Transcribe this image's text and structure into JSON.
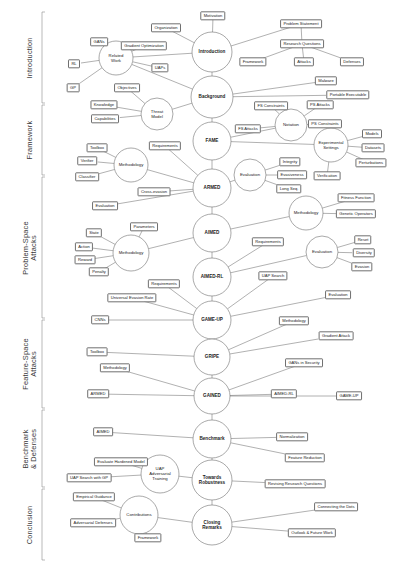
{
  "diagram": {
    "type": "mind-map",
    "stroke_color": "#6f6f6f",
    "text_color": "#1c1c1c",
    "background": "#ffffff"
  },
  "sections": [
    {
      "id": "introduction",
      "label": "Introduction",
      "y_top": 12,
      "y_bottom": 103
    },
    {
      "id": "framework",
      "label": "Framework",
      "y_top": 105,
      "y_bottom": 175
    },
    {
      "id": "ps-attacks",
      "label": "Problem-Space\nAttacks",
      "y_top": 177,
      "y_bottom": 318
    },
    {
      "id": "fs-attacks",
      "label": "Feature-Space\nAttacks",
      "y_top": 320,
      "y_bottom": 408
    },
    {
      "id": "benchmark",
      "label": "Benchmark\n& Defenses",
      "y_top": 410,
      "y_bottom": 487
    },
    {
      "id": "conclusion",
      "label": "Conclusion",
      "y_top": 489,
      "y_bottom": 560
    }
  ],
  "hubs": [
    {
      "id": "introduction",
      "label": "Introduction",
      "cx": 212,
      "cy": 52,
      "rx": 20,
      "ry": 20,
      "main": true
    },
    {
      "id": "background",
      "label": "Background",
      "cx": 212,
      "cy": 97,
      "rx": 21,
      "ry": 21,
      "main": true
    },
    {
      "id": "fame",
      "label": "FAME",
      "cx": 212,
      "cy": 141,
      "rx": 19,
      "ry": 19,
      "main": true
    },
    {
      "id": "armed",
      "label": "ARMED",
      "cx": 212,
      "cy": 188,
      "rx": 19,
      "ry": 19,
      "main": true
    },
    {
      "id": "aimed",
      "label": "AIMED",
      "cx": 212,
      "cy": 233,
      "rx": 19,
      "ry": 19,
      "main": true
    },
    {
      "id": "aimed-rl",
      "label": "AIMED-RL",
      "cx": 212,
      "cy": 277,
      "rx": 19,
      "ry": 19,
      "main": true
    },
    {
      "id": "game-up",
      "label": "GAME-UP",
      "cx": 212,
      "cy": 320,
      "rx": 19,
      "ry": 19,
      "main": true
    },
    {
      "id": "gripe",
      "label": "GRIPE",
      "cx": 212,
      "cy": 357,
      "rx": 18,
      "ry": 18,
      "main": true
    },
    {
      "id": "gained",
      "label": "GAINED",
      "cx": 212,
      "cy": 396,
      "rx": 18,
      "ry": 18,
      "main": true
    },
    {
      "id": "benchmark",
      "label": "Benchmark",
      "cx": 212,
      "cy": 439,
      "rx": 19,
      "ry": 19,
      "main": true
    },
    {
      "id": "towards-rob",
      "label": "Towards\nRobustness",
      "cx": 212,
      "cy": 480,
      "rx": 20,
      "ry": 20,
      "main": true
    },
    {
      "id": "closing",
      "label": "Closing\nRemarks",
      "cx": 212,
      "cy": 525,
      "rx": 20,
      "ry": 20,
      "main": true
    },
    {
      "id": "related-work",
      "label": "Related\nWork",
      "cx": 116,
      "cy": 58,
      "rx": 17,
      "ry": 17,
      "main": false
    },
    {
      "id": "threat-model",
      "label": "Threat\nModel",
      "cx": 157,
      "cy": 114,
      "rx": 16,
      "ry": 16,
      "main": false
    },
    {
      "id": "notation",
      "label": "Notation",
      "cx": 291,
      "cy": 125,
      "rx": 16,
      "ry": 16,
      "main": false
    },
    {
      "id": "exp-settings",
      "label": "Experimental\nSettings",
      "cx": 331,
      "cy": 145,
      "rx": 17,
      "ry": 17,
      "main": false
    },
    {
      "id": "methodology-1",
      "label": "Methodology",
      "cx": 131,
      "cy": 165,
      "rx": 17,
      "ry": 17,
      "main": false
    },
    {
      "id": "evaluation-1",
      "label": "Evaluation",
      "cx": 250,
      "cy": 175,
      "rx": 16,
      "ry": 16,
      "main": false
    },
    {
      "id": "methodology-2",
      "label": "Methodology",
      "cx": 306,
      "cy": 213,
      "rx": 17,
      "ry": 17,
      "main": false
    },
    {
      "id": "methodology-3",
      "label": "Methodology",
      "cx": 131,
      "cy": 253,
      "rx": 18,
      "ry": 18,
      "main": false
    },
    {
      "id": "evaluation-2",
      "label": "Evaluation",
      "cx": 322,
      "cy": 252,
      "rx": 16,
      "ry": 16,
      "main": false
    },
    {
      "id": "uap-adv-train",
      "label": "UAP\nAdversarial\nTraining",
      "cx": 160,
      "cy": 474,
      "rx": 19,
      "ry": 19,
      "main": false
    },
    {
      "id": "contributions",
      "label": "Contributions",
      "cx": 139,
      "cy": 515,
      "rx": 19,
      "ry": 19,
      "main": false
    }
  ],
  "leaves": [
    {
      "id": "motivation",
      "label": "Motivation",
      "cx": 213,
      "cy": 16,
      "parent": "introduction"
    },
    {
      "id": "organization",
      "label": "Organization",
      "cx": 166,
      "cy": 28,
      "parent": "introduction"
    },
    {
      "id": "problem-statement",
      "label": "Problem Statement",
      "cx": 301,
      "cy": 24,
      "parent": "introduction"
    },
    {
      "id": "research-questions",
      "label": "Research Questions",
      "cx": 302,
      "cy": 44,
      "parent": "problem-statement"
    },
    {
      "id": "rq-framework",
      "label": "Framework",
      "cx": 253,
      "cy": 62,
      "parent": "research-questions"
    },
    {
      "id": "rq-attacks",
      "label": "Attacks",
      "cx": 304,
      "cy": 62,
      "parent": "research-questions"
    },
    {
      "id": "rq-defenses",
      "label": "Defenses",
      "cx": 352,
      "cy": 62,
      "parent": "research-questions"
    },
    {
      "id": "gans",
      "label": "GANs",
      "cx": 99,
      "cy": 42,
      "parent": "related-work"
    },
    {
      "id": "gradient-optimization",
      "label": "Gradient Optimization",
      "cx": 144,
      "cy": 46,
      "parent": "related-work"
    },
    {
      "id": "rl",
      "label": "RL",
      "cx": 74,
      "cy": 64,
      "parent": "related-work"
    },
    {
      "id": "uaps",
      "label": "UAPs",
      "cx": 160,
      "cy": 68,
      "parent": "related-work"
    },
    {
      "id": "gp",
      "label": "GP",
      "cx": 73,
      "cy": 88,
      "parent": "related-work"
    },
    {
      "id": "objectives",
      "label": "Objectives",
      "cx": 127,
      "cy": 88,
      "parent": "threat-model"
    },
    {
      "id": "malware",
      "label": "Malware",
      "cx": 326,
      "cy": 81,
      "parent": "background"
    },
    {
      "id": "portable-executable",
      "label": "Portable Executable",
      "cx": 348,
      "cy": 95,
      "parent": "background"
    },
    {
      "id": "knowledge",
      "label": "Knowledge",
      "cx": 104,
      "cy": 105,
      "parent": "threat-model"
    },
    {
      "id": "capabilities",
      "label": "Capabilities",
      "cx": 105,
      "cy": 119,
      "parent": "threat-model"
    },
    {
      "id": "fs-attacks-n",
      "label": "FS Attacks",
      "cx": 248,
      "cy": 129,
      "parent": "notation"
    },
    {
      "id": "fs-constraints-n",
      "label": "FS Constraints",
      "cx": 271,
      "cy": 106,
      "parent": "notation"
    },
    {
      "id": "ps-attacks-n",
      "label": "PS Attacks",
      "cx": 320,
      "cy": 105,
      "parent": "notation"
    },
    {
      "id": "ps-constraints-n",
      "label": "PS Constraints",
      "cx": 325,
      "cy": 124,
      "parent": "notation"
    },
    {
      "id": "models",
      "label": "Models",
      "cx": 372,
      "cy": 134,
      "parent": "exp-settings"
    },
    {
      "id": "datasets",
      "label": "Datasets",
      "cx": 373,
      "cy": 148,
      "parent": "exp-settings"
    },
    {
      "id": "perturbations",
      "label": "Perturbations",
      "cx": 371,
      "cy": 163,
      "parent": "exp-settings"
    },
    {
      "id": "verification",
      "label": "Verification",
      "cx": 327,
      "cy": 176,
      "parent": "exp-settings"
    },
    {
      "id": "toolbox-1",
      "label": "Toolbox",
      "cx": 97,
      "cy": 148,
      "parent": "methodology-1"
    },
    {
      "id": "verifier",
      "label": "Verifier",
      "cx": 87,
      "cy": 161,
      "parent": "methodology-1"
    },
    {
      "id": "classifier",
      "label": "Classifier",
      "cx": 87,
      "cy": 177,
      "parent": "methodology-1"
    },
    {
      "id": "requirements-1",
      "label": "Requirements",
      "cx": 165,
      "cy": 146,
      "parent": "armed"
    },
    {
      "id": "cross-evasion",
      "label": "Cross-evasion",
      "cx": 154,
      "cy": 192,
      "parent": "armed"
    },
    {
      "id": "evaluation-leaf-1",
      "label": "Evaluation",
      "cx": 105,
      "cy": 206,
      "parent": "armed"
    },
    {
      "id": "integrity",
      "label": "Integrity",
      "cx": 290,
      "cy": 162,
      "parent": "evaluation-1"
    },
    {
      "id": "evasiveness",
      "label": "Evasiveness",
      "cx": 292,
      "cy": 175,
      "parent": "evaluation-1"
    },
    {
      "id": "long-seq",
      "label": "Long Seq.",
      "cx": 289,
      "cy": 189,
      "parent": "evaluation-1"
    },
    {
      "id": "fitness-function",
      "label": "Fitness Function",
      "cx": 356,
      "cy": 198,
      "parent": "methodology-2"
    },
    {
      "id": "genetic-operators",
      "label": "Genetic Operators",
      "cx": 356,
      "cy": 214,
      "parent": "methodology-2"
    },
    {
      "id": "parameters",
      "label": "Parameters",
      "cx": 144,
      "cy": 227,
      "parent": "methodology-3"
    },
    {
      "id": "state",
      "label": "State",
      "cx": 94,
      "cy": 233,
      "parent": "methodology-3"
    },
    {
      "id": "action",
      "label": "Action",
      "cx": 84,
      "cy": 247,
      "parent": "methodology-3"
    },
    {
      "id": "reward",
      "label": "Reward",
      "cx": 85,
      "cy": 260,
      "parent": "methodology-3"
    },
    {
      "id": "penalty",
      "label": "Penalty",
      "cx": 99,
      "cy": 272,
      "parent": "methodology-3"
    },
    {
      "id": "requirements-2",
      "label": "Requirements",
      "cx": 268,
      "cy": 242,
      "parent": "aimed-rl"
    },
    {
      "id": "reset",
      "label": "Reset",
      "cx": 363,
      "cy": 240,
      "parent": "evaluation-2"
    },
    {
      "id": "diversity",
      "label": "Diversity",
      "cx": 364,
      "cy": 253,
      "parent": "evaluation-2"
    },
    {
      "id": "evasion",
      "label": "Evasion",
      "cx": 362,
      "cy": 267,
      "parent": "evaluation-2"
    },
    {
      "id": "uap-search",
      "label": "UAP Search",
      "cx": 273,
      "cy": 276,
      "parent": "game-up"
    },
    {
      "id": "requirements-3",
      "label": "Requirements",
      "cx": 164,
      "cy": 284,
      "parent": "game-up"
    },
    {
      "id": "universal-evasion",
      "label": "Universal Evasion Rate",
      "cx": 132,
      "cy": 298,
      "parent": "game-up"
    },
    {
      "id": "evaluation-leaf-2",
      "label": "Evaluation",
      "cx": 338,
      "cy": 295,
      "parent": "game-up"
    },
    {
      "id": "cnns",
      "label": "CNNs",
      "cx": 100,
      "cy": 320,
      "parent": "game-up"
    },
    {
      "id": "methodology-leaf-1",
      "label": "Methodology",
      "cx": 294,
      "cy": 321,
      "parent": "gripe"
    },
    {
      "id": "toolbox-2",
      "label": "Toolbox",
      "cx": 97,
      "cy": 352,
      "parent": "gripe"
    },
    {
      "id": "gradient-attack",
      "label": "Gradient Attack",
      "cx": 336,
      "cy": 336,
      "parent": "gripe"
    },
    {
      "id": "gans-in-security",
      "label": "GANs in Security",
      "cx": 304,
      "cy": 363,
      "parent": "gained"
    },
    {
      "id": "methodology-leaf-2",
      "label": "Methodology",
      "cx": 115,
      "cy": 368,
      "parent": "gained"
    },
    {
      "id": "armed-leaf",
      "label": "ARMED",
      "cx": 98,
      "cy": 394,
      "parent": "gained"
    },
    {
      "id": "aimed-rl-leaf",
      "label": "AIMED-RL",
      "cx": 284,
      "cy": 394,
      "parent": "gained"
    },
    {
      "id": "game-up-leaf",
      "label": "GAME-UP",
      "cx": 349,
      "cy": 396,
      "parent": "gained"
    },
    {
      "id": "aimed-leaf",
      "label": "AIMED",
      "cx": 103,
      "cy": 432,
      "parent": "benchmark"
    },
    {
      "id": "normalization",
      "label": "Normalization",
      "cx": 292,
      "cy": 437,
      "parent": "benchmark"
    },
    {
      "id": "feature-reduction",
      "label": "Feature Reduction",
      "cx": 305,
      "cy": 458,
      "parent": "benchmark"
    },
    {
      "id": "evaluate-hardened",
      "label": "Evaluate Hardened Model",
      "cx": 121,
      "cy": 462,
      "parent": "uap-adv-train"
    },
    {
      "id": "uap-search-gp",
      "label": "UAP Search with GP",
      "cx": 89,
      "cy": 478,
      "parent": "uap-adv-train"
    },
    {
      "id": "revising-rq",
      "label": "Revising Research Questions",
      "cx": 295,
      "cy": 484,
      "parent": "towards-rob"
    },
    {
      "id": "empirical-guidance",
      "label": "Empirical Guidance",
      "cx": 94,
      "cy": 497,
      "parent": "contributions"
    },
    {
      "id": "adversarial-defenses",
      "label": "Adversarial Defenses",
      "cx": 93,
      "cy": 523,
      "parent": "contributions"
    },
    {
      "id": "framework-leaf",
      "label": "Framework",
      "cx": 148,
      "cy": 538,
      "parent": "contributions"
    },
    {
      "id": "connecting-dots",
      "label": "Connecting the Dots",
      "cx": 336,
      "cy": 507,
      "parent": "closing"
    },
    {
      "id": "outlook-future",
      "label": "Outlook & Future Work",
      "cx": 312,
      "cy": 533,
      "parent": "closing"
    }
  ],
  "edges": [
    [
      "introduction",
      "background"
    ],
    [
      "background",
      "fame"
    ],
    [
      "fame",
      "armed"
    ],
    [
      "armed",
      "aimed"
    ],
    [
      "aimed",
      "aimed-rl"
    ],
    [
      "aimed-rl",
      "game-up"
    ],
    [
      "game-up",
      "gripe"
    ],
    [
      "gripe",
      "gained"
    ],
    [
      "gained",
      "benchmark"
    ],
    [
      "benchmark",
      "towards-rob"
    ],
    [
      "towards-rob",
      "closing"
    ],
    [
      "introduction",
      "motivation"
    ],
    [
      "introduction",
      "organization"
    ],
    [
      "introduction",
      "problem-statement"
    ],
    [
      "problem-statement",
      "research-questions"
    ],
    [
      "research-questions",
      "rq-framework"
    ],
    [
      "research-questions",
      "rq-attacks"
    ],
    [
      "research-questions",
      "rq-defenses"
    ],
    [
      "introduction",
      "related-work"
    ],
    [
      "related-work",
      "gans"
    ],
    [
      "related-work",
      "gradient-optimization"
    ],
    [
      "related-work",
      "rl"
    ],
    [
      "related-work",
      "uaps"
    ],
    [
      "related-work",
      "gp"
    ],
    [
      "related-work",
      "background"
    ],
    [
      "background",
      "malware"
    ],
    [
      "background",
      "portable-executable"
    ],
    [
      "background",
      "threat-model"
    ],
    [
      "threat-model",
      "knowledge"
    ],
    [
      "threat-model",
      "capabilities"
    ],
    [
      "threat-model",
      "objectives"
    ],
    [
      "fame",
      "notation"
    ],
    [
      "notation",
      "fs-attacks-n"
    ],
    [
      "notation",
      "fs-constraints-n"
    ],
    [
      "notation",
      "ps-attacks-n"
    ],
    [
      "notation",
      "ps-constraints-n"
    ],
    [
      "fame",
      "exp-settings"
    ],
    [
      "exp-settings",
      "models"
    ],
    [
      "exp-settings",
      "datasets"
    ],
    [
      "exp-settings",
      "perturbations"
    ],
    [
      "exp-settings",
      "verification"
    ],
    [
      "armed",
      "methodology-1"
    ],
    [
      "methodology-1",
      "toolbox-1"
    ],
    [
      "methodology-1",
      "verifier"
    ],
    [
      "methodology-1",
      "classifier"
    ],
    [
      "armed",
      "requirements-1"
    ],
    [
      "armed",
      "cross-evasion"
    ],
    [
      "armed",
      "evaluation-leaf-1"
    ],
    [
      "armed",
      "evaluation-1"
    ],
    [
      "evaluation-1",
      "integrity"
    ],
    [
      "evaluation-1",
      "evasiveness"
    ],
    [
      "evaluation-1",
      "long-seq"
    ],
    [
      "aimed",
      "methodology-2"
    ],
    [
      "methodology-2",
      "fitness-function"
    ],
    [
      "methodology-2",
      "genetic-operators"
    ],
    [
      "aimed",
      "methodology-3"
    ],
    [
      "methodology-3",
      "parameters"
    ],
    [
      "methodology-3",
      "state"
    ],
    [
      "methodology-3",
      "action"
    ],
    [
      "methodology-3",
      "reward"
    ],
    [
      "methodology-3",
      "penalty"
    ],
    [
      "aimed-rl",
      "requirements-2"
    ],
    [
      "aimed-rl",
      "evaluation-2"
    ],
    [
      "evaluation-2",
      "reset"
    ],
    [
      "evaluation-2",
      "diversity"
    ],
    [
      "evaluation-2",
      "evasion"
    ],
    [
      "game-up",
      "uap-search"
    ],
    [
      "game-up",
      "requirements-3"
    ],
    [
      "game-up",
      "universal-evasion"
    ],
    [
      "game-up",
      "evaluation-leaf-2"
    ],
    [
      "game-up",
      "cnns"
    ],
    [
      "gripe",
      "methodology-leaf-1"
    ],
    [
      "gripe",
      "toolbox-2"
    ],
    [
      "gripe",
      "gradient-attack"
    ],
    [
      "gained",
      "gans-in-security"
    ],
    [
      "gained",
      "methodology-leaf-2"
    ],
    [
      "gained",
      "armed-leaf"
    ],
    [
      "gained",
      "aimed-rl-leaf"
    ],
    [
      "gained",
      "game-up-leaf"
    ],
    [
      "benchmark",
      "aimed-leaf"
    ],
    [
      "benchmark",
      "normalization"
    ],
    [
      "benchmark",
      "feature-reduction"
    ],
    [
      "towards-rob",
      "uap-adv-train"
    ],
    [
      "uap-adv-train",
      "evaluate-hardened"
    ],
    [
      "uap-adv-train",
      "uap-search-gp"
    ],
    [
      "towards-rob",
      "revising-rq"
    ],
    [
      "closing",
      "contributions"
    ],
    [
      "contributions",
      "empirical-guidance"
    ],
    [
      "contributions",
      "adversarial-defenses"
    ],
    [
      "contributions",
      "framework-leaf"
    ],
    [
      "closing",
      "connecting-dots"
    ],
    [
      "closing",
      "outlook-future"
    ]
  ]
}
